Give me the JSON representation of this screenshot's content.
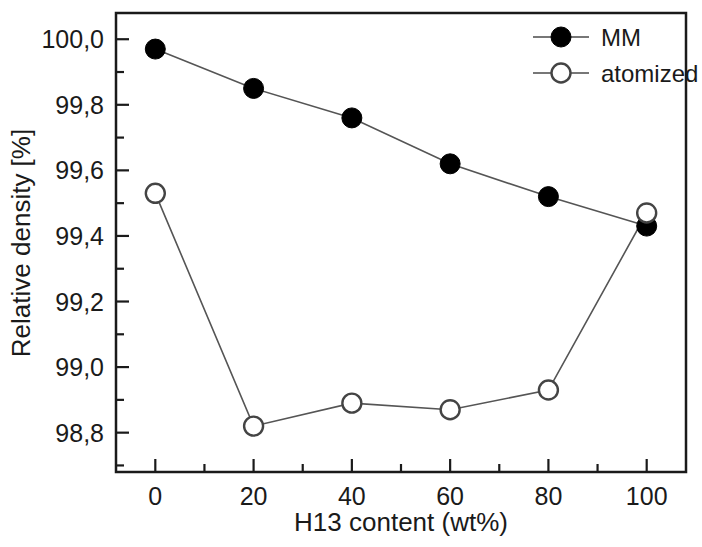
{
  "chart_data": {
    "type": "line",
    "title": "",
    "xlabel": "H13 content (wt%)",
    "ylabel": "Relative density [%]",
    "x": [
      0,
      20,
      40,
      60,
      80,
      100
    ],
    "xlim": [
      -8,
      108
    ],
    "ylim": [
      98.68,
      100.08
    ],
    "xticks": [
      "0",
      "20",
      "40",
      "60",
      "80",
      "100"
    ],
    "yticks": [
      "98,8",
      "99,0",
      "99,2",
      "99,4",
      "99,6",
      "99,8",
      "100,0"
    ],
    "ytick_values": [
      98.8,
      99.0,
      99.2,
      99.4,
      99.6,
      99.8,
      100.0
    ],
    "minor_ticks": true,
    "grid": false,
    "legend_position": "top-right",
    "series": [
      {
        "name": "MM",
        "marker": "filled-circle",
        "color": "#000000",
        "values": [
          99.97,
          99.85,
          99.76,
          99.62,
          99.52,
          99.43
        ]
      },
      {
        "name": "atomized",
        "marker": "open-circle",
        "color": "#000000",
        "values": [
          99.53,
          98.82,
          98.89,
          98.87,
          98.93,
          99.47
        ]
      }
    ]
  },
  "legend": {
    "entries": [
      {
        "label": "MM",
        "marker": "filled-circle"
      },
      {
        "label": "atomized",
        "marker": "open-circle"
      }
    ]
  },
  "axes": {
    "x_title": "H13 content (wt%)",
    "y_title": "Relative density [%]",
    "x_tick_labels": [
      "0",
      "20",
      "40",
      "60",
      "80",
      "100"
    ],
    "y_tick_labels": [
      "98,8",
      "99,0",
      "99,2",
      "99,4",
      "99,6",
      "99,8",
      "100,0"
    ]
  },
  "colors": {
    "line": "#555555",
    "marker_fill": "#000000",
    "marker_open": "#ffffff",
    "axis": "#1a1a1a",
    "background": "#ffffff"
  }
}
